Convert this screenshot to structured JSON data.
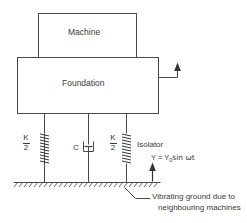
{
  "diagram": {
    "title_machine": "Machine",
    "title_foundation": "Foundation",
    "isolator_label": "Isolator",
    "damper_label": "C",
    "spring_left": {
      "numerator": "K",
      "denominator": "2"
    },
    "spring_right": {
      "numerator": "K",
      "denominator": "2"
    },
    "ground_excitation": {
      "prefix": "Y = Y",
      "subscript": "0",
      "suffix": "sin ωt"
    },
    "caption": {
      "line1": "Vibrating ground due to",
      "line2": "neighbouring machines"
    },
    "icons": {
      "spring": "spring-coil-icon",
      "damper": "dashpot-damper-icon",
      "ground": "hatched-ground-icon",
      "motion_arrow_foundation": "up-arrow-icon",
      "motion_arrow_ground": "up-arrow-icon",
      "leader_line": "leader-line-icon"
    },
    "colors": {
      "stroke": "#4a4a4a",
      "text": "#3a3a3a",
      "background": "#ffffff"
    }
  }
}
